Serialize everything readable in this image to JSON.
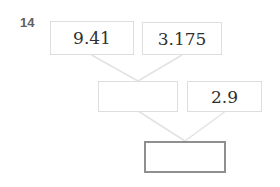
{
  "problem": {
    "number": "14"
  },
  "diagram": {
    "type": "computation-tree",
    "nodes": {
      "top_left": {
        "value": "9.41"
      },
      "top_right": {
        "value": "3.175"
      },
      "mid_left": {
        "value": ""
      },
      "mid_right": {
        "value": "2.9"
      },
      "bottom": {
        "value": ""
      }
    },
    "edges": [
      {
        "from": "top_left",
        "to": "mid_left"
      },
      {
        "from": "top_right",
        "to": "mid_left"
      },
      {
        "from": "mid_left",
        "to": "bottom"
      },
      {
        "from": "mid_right",
        "to": "bottom"
      }
    ],
    "colors": {
      "background": "#ffffff",
      "box_border_light": "#dedede",
      "box_border_dark": "#8f8f8f",
      "connector_line": "#e3e3e3",
      "value_text": "#2f2f2f",
      "problem_number_text": "#5f5f5f"
    }
  }
}
